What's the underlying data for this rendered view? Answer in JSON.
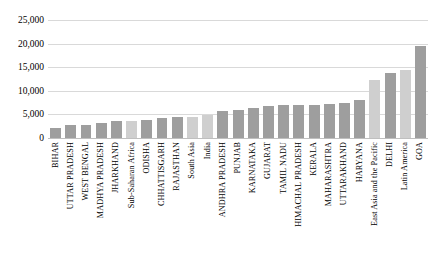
{
  "chart_data": {
    "type": "bar",
    "title": "",
    "subtitle": "",
    "xlabel": "",
    "ylabel": "",
    "ylim": [
      0,
      25000
    ],
    "ytick_values": [
      0,
      5000,
      10000,
      15000,
      20000,
      25000
    ],
    "ytick_labels": [
      "0",
      "5,000",
      "10,000",
      "15,000",
      "20,000",
      "25,000"
    ],
    "grid": true,
    "legend": "none",
    "orientation": "vertical",
    "categories": [
      "BIHAR",
      "UTTAR PRADESH",
      "WEST BENGAL",
      "MADHYA PRADESH",
      "JHARKHAND",
      "Sub-Saharan Africa",
      "ODISHA",
      "CHHATTISGARH",
      "RAJASTHAN",
      "South Asia",
      "India",
      "ANDHRA PRADESH",
      "PUNJAB",
      "KARNATAKA",
      "GUJARAT",
      "TAMIL NADU",
      "HIMACHAL PRADESH",
      "KERALA",
      "MAHARASHTRA",
      "UTTARAKHAND",
      "HARYANA",
      "East Asia and the Pacific",
      "DELHI",
      "Latin America",
      "GOA"
    ],
    "values": [
      2100,
      2700,
      2800,
      3200,
      3500,
      3600,
      3900,
      4300,
      4400,
      4500,
      4900,
      5700,
      6000,
      6300,
      6800,
      6900,
      7000,
      7100,
      7300,
      7500,
      8000,
      12300,
      13800,
      14500,
      19400
    ],
    "series_shades": [
      "dark",
      "dark",
      "dark",
      "dark",
      "dark",
      "light",
      "dark",
      "dark",
      "dark",
      "light",
      "light",
      "dark",
      "dark",
      "dark",
      "dark",
      "dark",
      "dark",
      "dark",
      "dark",
      "dark",
      "dark",
      "light",
      "dark",
      "light",
      "dark"
    ],
    "colors": {
      "bar_dark": "#9e9e9e",
      "bar_light": "#cfcfcf",
      "gridline": "#d9d9d9",
      "axis": "#bfbfbf",
      "text": "#000000",
      "background": "#ffffff"
    }
  }
}
